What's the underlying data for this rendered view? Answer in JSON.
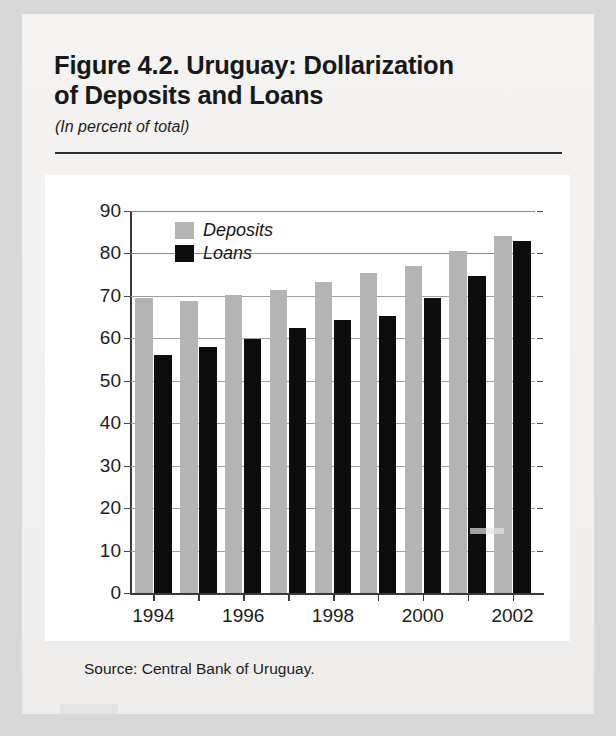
{
  "figure": {
    "title": "Figure 4.2. Uruguay: Dollarization of Deposits and Loans",
    "title_line1": "Figure 4.2. Uruguay: Dollarization",
    "title_line2": "of Deposits and Loans",
    "subtitle": "(In percent of total)",
    "source": "Source: Central Bank of Uruguay."
  },
  "legend": {
    "position": "top-left-inside",
    "items": [
      {
        "label": "Deposits",
        "color": "#b4b4b4"
      },
      {
        "label": "Loans",
        "color": "#0d0d0d"
      }
    ]
  },
  "axis": {
    "y_ticks": [
      "90",
      "80",
      "70",
      "60",
      "50",
      "40",
      "30",
      "20",
      "10",
      "0"
    ],
    "x_ticks": [
      "1994",
      "1996",
      "1998",
      "2000",
      "2002"
    ]
  },
  "chart_data": {
    "type": "bar",
    "title": "Figure 4.2. Uruguay: Dollarization of Deposits and Loans",
    "subtitle": "(In percent of total)",
    "xlabel": "",
    "ylabel": "",
    "ylim": [
      0,
      90
    ],
    "ytick_step": 10,
    "grid": true,
    "legend_position": "upper left",
    "categories": [
      "1994",
      "1995",
      "1996",
      "1997",
      "1998",
      "1999",
      "2000",
      "2001",
      "2002"
    ],
    "visible_xticklabels": [
      "1994",
      "1996",
      "1998",
      "2000",
      "2002"
    ],
    "series": [
      {
        "name": "Deposits",
        "color": "#b4b4b4",
        "values": [
          69.5,
          68.7,
          70.3,
          71.3,
          73.2,
          75.4,
          77.0,
          80.5,
          84.0
        ]
      },
      {
        "name": "Loans",
        "color": "#0d0d0d",
        "values": [
          56.0,
          58.0,
          59.8,
          62.5,
          64.3,
          65.2,
          69.5,
          74.8,
          83.0
        ]
      }
    ],
    "source": "Source: Central Bank of Uruguay."
  }
}
